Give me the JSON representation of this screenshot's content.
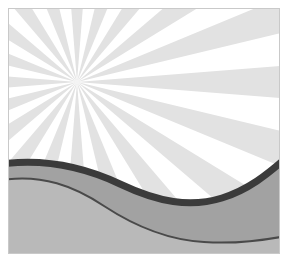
{
  "illustration": {
    "title": "Sunburst Landscape",
    "kind": "decorative-vector-illustration",
    "canvas": {
      "width": 289,
      "height": 261
    },
    "artboard": {
      "x": 8,
      "y": 8,
      "width": 272,
      "height": 246
    },
    "background_color": "#ffffff",
    "border_color": "#c9c9c9",
    "shadow_color": "#d6d6d6"
  },
  "sunburst": {
    "name": "radial-ray-burst",
    "center": {
      "x": 69,
      "y": 74
    },
    "ray_count": 20,
    "ray_color": "#e2e2e2",
    "gap_color": "#ffffff",
    "ray_angular_width_deg": 9,
    "ray_pitch_deg": 18,
    "start_angle_deg": 0,
    "ray_length": 480
  },
  "hills": [
    {
      "name": "back-hill",
      "fill": "#a2a2a2",
      "outline_color": "#3b3b3b",
      "outline_thickness": 7,
      "crest_left_y": 156,
      "trough_right_y": 184,
      "end_right_y": 150
    },
    {
      "name": "front-hill",
      "fill": "#b9b9b9",
      "outline_color": "#4a4a4a",
      "outline_thickness": 2,
      "crest_left_y": 172,
      "trough_right_y": 233
    }
  ],
  "palette": {
    "white": "#ffffff",
    "ray_gray": "#e2e2e2",
    "mid_gray": "#a2a2a2",
    "light_gray": "#b9b9b9",
    "dark_outline": "#3b3b3b",
    "thin_outline": "#4a4a4a",
    "border": "#c9c9c9",
    "shadow": "#d6d6d6"
  }
}
